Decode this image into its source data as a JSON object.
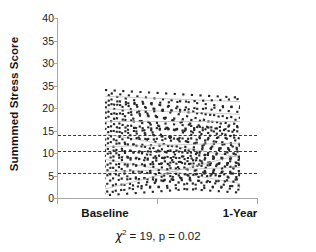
{
  "chart_data": {
    "type": "line",
    "title": "",
    "subtitle": "",
    "xlabel": "",
    "ylabel": "Summmed Stress Score",
    "caption": {
      "statistic_symbol": "χ",
      "statistic_exponent": "2",
      "statistic_text": " = 19, p = 0.02",
      "full_text": "χ² = 19, p = 0.02"
    },
    "categories": [
      "Baseline",
      "1-Year"
    ],
    "x_tick_labels": [
      "Baseline",
      "1-Year"
    ],
    "y_tick_labels": [
      "40",
      "35",
      "30",
      "35",
      "20",
      "15",
      "10",
      "5",
      "0"
    ],
    "y_tick_values": [
      40,
      35,
      30,
      25,
      20,
      15,
      10,
      5,
      0
    ],
    "ylim": [
      0,
      40
    ],
    "grid": false,
    "legend": "none",
    "line_style": "dotted",
    "series_description": "Individual subject trajectories from Baseline to 1-Year follow-up",
    "reference_lines": {
      "style": "dashed",
      "values": [
        14,
        10.5,
        5.5
      ]
    },
    "series": [
      {
        "name": "subject-01",
        "values": [
          24.0,
          22.3
        ]
      },
      {
        "name": "subject-02",
        "values": [
          23.4,
          20.0
        ]
      },
      {
        "name": "subject-03",
        "values": [
          23.0,
          17.2
        ]
      },
      {
        "name": "subject-04",
        "values": [
          22.6,
          21.4
        ]
      },
      {
        "name": "subject-05",
        "values": [
          22.2,
          15.6
        ]
      },
      {
        "name": "subject-06",
        "values": [
          21.7,
          19.1
        ]
      },
      {
        "name": "subject-07",
        "values": [
          21.3,
          13.2
        ]
      },
      {
        "name": "subject-08",
        "values": [
          21.0,
          17.8
        ]
      },
      {
        "name": "subject-09",
        "values": [
          20.6,
          22.0
        ]
      },
      {
        "name": "subject-10",
        "values": [
          20.2,
          14.4
        ]
      },
      {
        "name": "subject-11",
        "values": [
          19.8,
          18.6
        ]
      },
      {
        "name": "subject-12",
        "values": [
          19.4,
          11.0
        ]
      },
      {
        "name": "subject-13",
        "values": [
          19.0,
          16.4
        ]
      },
      {
        "name": "subject-14",
        "values": [
          18.6,
          20.4
        ]
      },
      {
        "name": "subject-15",
        "values": [
          18.2,
          12.6
        ]
      },
      {
        "name": "subject-16",
        "values": [
          17.8,
          15.0
        ]
      },
      {
        "name": "subject-17",
        "values": [
          17.4,
          9.4
        ]
      },
      {
        "name": "subject-18",
        "values": [
          17.0,
          17.0
        ]
      },
      {
        "name": "subject-19",
        "values": [
          16.6,
          13.8
        ]
      },
      {
        "name": "subject-20",
        "values": [
          16.2,
          10.2
        ]
      },
      {
        "name": "subject-21",
        "values": [
          15.8,
          14.8
        ]
      },
      {
        "name": "subject-22",
        "values": [
          15.4,
          7.6
        ]
      },
      {
        "name": "subject-23",
        "values": [
          15.0,
          12.0
        ]
      },
      {
        "name": "subject-24",
        "values": [
          14.6,
          16.0
        ]
      },
      {
        "name": "subject-25",
        "values": [
          14.2,
          9.0
        ]
      },
      {
        "name": "subject-26",
        "values": [
          13.8,
          11.6
        ]
      },
      {
        "name": "subject-27",
        "values": [
          13.4,
          6.2
        ]
      },
      {
        "name": "subject-28",
        "values": [
          13.0,
          13.4
        ]
      },
      {
        "name": "subject-29",
        "values": [
          12.6,
          8.4
        ]
      },
      {
        "name": "subject-30",
        "values": [
          12.2,
          10.8
        ]
      },
      {
        "name": "subject-31",
        "values": [
          11.8,
          5.0
        ]
      },
      {
        "name": "subject-32",
        "values": [
          11.4,
          12.2
        ]
      },
      {
        "name": "subject-33",
        "values": [
          11.0,
          7.0
        ]
      },
      {
        "name": "subject-34",
        "values": [
          10.6,
          9.8
        ]
      },
      {
        "name": "subject-35",
        "values": [
          10.2,
          4.0
        ]
      },
      {
        "name": "subject-36",
        "values": [
          9.8,
          11.2
        ]
      },
      {
        "name": "subject-37",
        "values": [
          9.4,
          6.6
        ]
      },
      {
        "name": "subject-38",
        "values": [
          9.0,
          8.8
        ]
      },
      {
        "name": "subject-39",
        "values": [
          8.6,
          3.2
        ]
      },
      {
        "name": "subject-40",
        "values": [
          8.2,
          10.0
        ]
      },
      {
        "name": "subject-41",
        "values": [
          7.8,
          5.4
        ]
      },
      {
        "name": "subject-42",
        "values": [
          7.4,
          7.8
        ]
      },
      {
        "name": "subject-43",
        "values": [
          7.0,
          2.4
        ]
      },
      {
        "name": "subject-44",
        "values": [
          6.6,
          9.2
        ]
      },
      {
        "name": "subject-45",
        "values": [
          6.2,
          4.6
        ]
      },
      {
        "name": "subject-46",
        "values": [
          5.8,
          6.8
        ]
      },
      {
        "name": "subject-47",
        "values": [
          5.4,
          1.8
        ]
      },
      {
        "name": "subject-48",
        "values": [
          5.0,
          8.0
        ]
      },
      {
        "name": "subject-49",
        "values": [
          4.4,
          3.6
        ]
      },
      {
        "name": "subject-50",
        "values": [
          3.8,
          6.0
        ]
      },
      {
        "name": "subject-51",
        "values": [
          3.2,
          1.2
        ]
      },
      {
        "name": "subject-52",
        "values": [
          2.6,
          5.6
        ]
      },
      {
        "name": "subject-53",
        "values": [
          2.0,
          9.6
        ]
      },
      {
        "name": "subject-54",
        "values": [
          1.4,
          4.2
        ]
      },
      {
        "name": "subject-55",
        "values": [
          1.0,
          7.4
        ]
      },
      {
        "name": "subject-56",
        "values": [
          0.6,
          2.8
        ]
      }
    ]
  }
}
